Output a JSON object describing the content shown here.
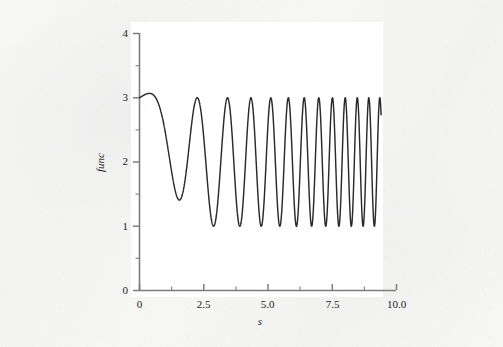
{
  "figure": {
    "background_color": "#f4f4f3",
    "plot_background_color": "#ffffff",
    "axis_color": "#7d7d7d",
    "curve_color": "#2a2a2a"
  },
  "chart_data": {
    "type": "line",
    "title": "",
    "subtitle": "",
    "xlabel": "s",
    "ylabel": "func",
    "xlim": [
      0,
      10
    ],
    "ylim": [
      0,
      4
    ],
    "grid": false,
    "legend": null,
    "x_ticks": [
      0,
      2.5,
      5.0,
      7.5,
      10.0
    ],
    "x_tick_labels": [
      "0",
      "2.5",
      "5.0",
      "7.5",
      "10.0"
    ],
    "x_minor_ticks": [
      1.25,
      3.75,
      6.25,
      8.75
    ],
    "y_ticks": [
      0,
      1,
      2,
      3,
      4
    ],
    "y_tick_labels": [
      "0",
      "1",
      "2",
      "3",
      "4"
    ],
    "y_minor_ticks": [
      0.5,
      1.5,
      2.5,
      3.5
    ],
    "series": [
      {
        "name": "func",
        "description": "Chirped oscillation with increasing frequency, baseline 2, amplitude 1, bounded between 1 and 3, truncated at s = 9.4",
        "baseline": 2,
        "amplitude": 1,
        "start_value": 3,
        "peak_value": 3,
        "trough_value": 1,
        "x_start": 0,
        "x_end": 9.4,
        "end_value": 2.8,
        "chirp_phase_a": 0.18,
        "chirp_phase_b": 0.118,
        "envelope_rise_x": 0.95,
        "envelope_rise_peak": 3.15,
        "peak_count": 17,
        "x": [
          0,
          0.95,
          1.75,
          2.6,
          3.35,
          4.0,
          4.6,
          5.1,
          5.55,
          5.95,
          6.35,
          6.7,
          7.0,
          7.3,
          7.6,
          7.85,
          8.1,
          8.35,
          8.6,
          8.8,
          9.0,
          9.2,
          9.4
        ],
        "y": [
          3,
          3.15,
          1,
          3,
          1,
          3,
          1,
          3,
          1,
          3,
          1,
          3,
          1,
          3,
          1,
          3,
          1,
          3,
          1,
          3,
          1,
          3,
          2.8
        ]
      }
    ]
  }
}
